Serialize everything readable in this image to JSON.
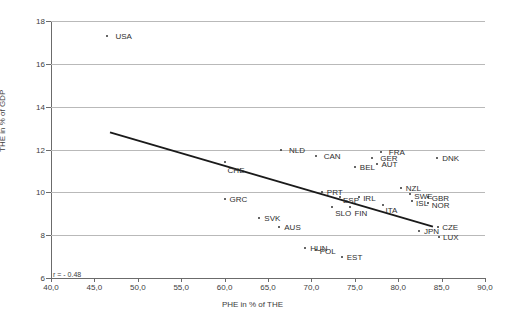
{
  "chart_data": {
    "type": "scatter",
    "title": "",
    "xlabel": "PHE in % of THE",
    "ylabel": "THE in % of GDP",
    "xlim": [
      40.0,
      90.0
    ],
    "ylim": [
      6,
      18
    ],
    "xticks": [
      "40,0",
      "45,0",
      "50,0",
      "55,0",
      "60,0",
      "65,0",
      "70,0",
      "75,0",
      "80,0",
      "85,0",
      "90,0"
    ],
    "xtick_values": [
      40,
      45,
      50,
      55,
      60,
      65,
      70,
      75,
      80,
      85,
      90
    ],
    "yticks": [
      "6",
      "8",
      "10",
      "12",
      "14",
      "16",
      "18"
    ],
    "ytick_values": [
      6,
      8,
      10,
      12,
      14,
      16,
      18
    ],
    "grid": "horizontal",
    "legend": "none",
    "annotation": "r = - 0.48",
    "trendline": {
      "x0": 46.8,
      "y0": 12.8,
      "x1": 84.0,
      "y1": 8.4
    },
    "points": [
      {
        "label": "USA",
        "x": 46.5,
        "y": 17.3,
        "lx": 8,
        "ly": 0
      },
      {
        "label": "NLD",
        "x": 66.5,
        "y": 12.0,
        "lx": 8,
        "ly": 0
      },
      {
        "label": "CHE",
        "x": 60.0,
        "y": 11.4,
        "lx": 3,
        "ly": 8
      },
      {
        "label": "CAN",
        "x": 70.5,
        "y": 11.7,
        "lx": 8,
        "ly": 0
      },
      {
        "label": "FRA",
        "x": 78.0,
        "y": 11.9,
        "lx": 8,
        "ly": 0
      },
      {
        "label": "GER",
        "x": 77.0,
        "y": 11.6,
        "lx": 8,
        "ly": 0
      },
      {
        "label": "AUT",
        "x": 77.5,
        "y": 11.3,
        "lx": 5,
        "ly": 0
      },
      {
        "label": "BEL",
        "x": 75.0,
        "y": 11.2,
        "lx": 5,
        "ly": 0
      },
      {
        "label": "DNK",
        "x": 84.5,
        "y": 11.6,
        "lx": 5,
        "ly": 0
      },
      {
        "label": "GRC",
        "x": 60.0,
        "y": 9.7,
        "lx": 5,
        "ly": 0
      },
      {
        "label": "SVK",
        "x": 64.0,
        "y": 8.8,
        "lx": 5,
        "ly": 0
      },
      {
        "label": "AUS",
        "x": 66.3,
        "y": 8.4,
        "lx": 5,
        "ly": 0
      },
      {
        "label": "PRT",
        "x": 71.2,
        "y": 10.0,
        "lx": 5,
        "ly": 0
      },
      {
        "label": "ESP",
        "x": 73.3,
        "y": 9.8,
        "lx": 3,
        "ly": 3
      },
      {
        "label": "IRL",
        "x": 75.5,
        "y": 9.8,
        "lx": 4,
        "ly": 1
      },
      {
        "label": "SLO",
        "x": 72.4,
        "y": 9.3,
        "lx": 3,
        "ly": 6
      },
      {
        "label": "FIN",
        "x": 74.5,
        "y": 9.3,
        "lx": 4,
        "ly": 6
      },
      {
        "label": "ITA",
        "x": 78.2,
        "y": 9.4,
        "lx": 3,
        "ly": 5
      },
      {
        "label": "NZL",
        "x": 80.3,
        "y": 10.2,
        "lx": 5,
        "ly": 0
      },
      {
        "label": "SWE",
        "x": 81.4,
        "y": 9.9,
        "lx": 4,
        "ly": 2
      },
      {
        "label": "ISL",
        "x": 81.6,
        "y": 9.6,
        "lx": 4,
        "ly": 2
      },
      {
        "label": "GBR",
        "x": 83.4,
        "y": 9.8,
        "lx": 4,
        "ly": 1
      },
      {
        "label": "NOR",
        "x": 83.4,
        "y": 9.5,
        "lx": 4,
        "ly": 2
      },
      {
        "label": "JPN",
        "x": 82.4,
        "y": 8.2,
        "lx": 5,
        "ly": 0
      },
      {
        "label": "CZE",
        "x": 84.6,
        "y": 8.4,
        "lx": 4,
        "ly": 0
      },
      {
        "label": "LUX",
        "x": 84.7,
        "y": 7.9,
        "lx": 4,
        "ly": 0
      },
      {
        "label": "HUN",
        "x": 69.3,
        "y": 7.4,
        "lx": 5,
        "ly": 0
      },
      {
        "label": "POL",
        "x": 70.5,
        "y": 7.3,
        "lx": 4,
        "ly": 1
      },
      {
        "label": "EST",
        "x": 73.5,
        "y": 7.0,
        "lx": 5,
        "ly": 0
      }
    ]
  }
}
